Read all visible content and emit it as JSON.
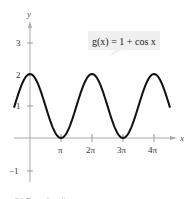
{
  "chart_data": {
    "type": "line",
    "title": "",
    "xlabel": "x",
    "ylabel": "y",
    "function": "g(x) = 1 + cos x",
    "annotation": "g(x) = 1 + cos x",
    "x_tick_labels": [
      "π",
      "2π",
      "3π",
      "4π"
    ],
    "y_tick_labels": [
      "-1",
      "1",
      "2",
      "3"
    ],
    "xlim": [
      -1.6,
      4.6
    ],
    "xlim_units": "multiples of π",
    "ylim": [
      -1.2,
      3.4
    ],
    "grid": false,
    "series": [
      {
        "name": "g(x) = 1 + cos x",
        "x_in_pi": [
          -0.5,
          0,
          0.5,
          1,
          1.5,
          2,
          2.5,
          3,
          3.5,
          4,
          4.5
        ],
        "values": [
          1,
          2,
          1,
          0,
          1,
          2,
          1,
          0,
          1,
          2,
          1
        ]
      }
    ],
    "caption": "(b) Even function"
  },
  "labels": {
    "x_axis": "x",
    "y_axis": "y",
    "equation": "g(x) = 1 + cos x",
    "xticks": [
      "π",
      "2π",
      "3π",
      "4π"
    ],
    "yticks": {
      "neg1": "−1",
      "one": "1",
      "two": "2",
      "three": "3"
    },
    "caption": "(b) Even function"
  }
}
